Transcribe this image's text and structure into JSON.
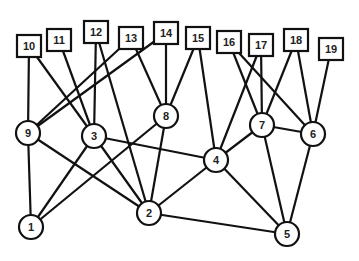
{
  "diagram": {
    "type": "graph",
    "square_nodes": [
      {
        "id": "10",
        "x": 29,
        "y": 46
      },
      {
        "id": "11",
        "x": 59,
        "y": 40
      },
      {
        "id": "12",
        "x": 96,
        "y": 32
      },
      {
        "id": "13",
        "x": 131,
        "y": 38
      },
      {
        "id": "14",
        "x": 166,
        "y": 33
      },
      {
        "id": "15",
        "x": 198,
        "y": 38
      },
      {
        "id": "16",
        "x": 229,
        "y": 42
      },
      {
        "id": "17",
        "x": 261,
        "y": 45
      },
      {
        "id": "18",
        "x": 296,
        "y": 40
      },
      {
        "id": "19",
        "x": 331,
        "y": 49
      }
    ],
    "circle_nodes": [
      {
        "id": "9",
        "x": 28,
        "y": 133
      },
      {
        "id": "3",
        "x": 94,
        "y": 136
      },
      {
        "id": "8",
        "x": 166,
        "y": 116
      },
      {
        "id": "7",
        "x": 262,
        "y": 125
      },
      {
        "id": "6",
        "x": 313,
        "y": 134
      },
      {
        "id": "4",
        "x": 216,
        "y": 160
      },
      {
        "id": "1",
        "x": 31,
        "y": 227
      },
      {
        "id": "2",
        "x": 149,
        "y": 213
      },
      {
        "id": "5",
        "x": 287,
        "y": 234
      }
    ],
    "edges": [
      [
        "10",
        "9"
      ],
      [
        "10",
        "3"
      ],
      [
        "11",
        "3"
      ],
      [
        "12",
        "3"
      ],
      [
        "12",
        "2"
      ],
      [
        "13",
        "9"
      ],
      [
        "13",
        "8"
      ],
      [
        "14",
        "9"
      ],
      [
        "14",
        "8"
      ],
      [
        "15",
        "8"
      ],
      [
        "15",
        "4"
      ],
      [
        "16",
        "7"
      ],
      [
        "16",
        "6"
      ],
      [
        "17",
        "7"
      ],
      [
        "17",
        "4"
      ],
      [
        "18",
        "7"
      ],
      [
        "18",
        "6"
      ],
      [
        "19",
        "6"
      ],
      [
        "9",
        "1"
      ],
      [
        "9",
        "2"
      ],
      [
        "3",
        "1"
      ],
      [
        "3",
        "2"
      ],
      [
        "3",
        "4"
      ],
      [
        "8",
        "1"
      ],
      [
        "8",
        "2"
      ],
      [
        "4",
        "2"
      ],
      [
        "4",
        "7"
      ],
      [
        "4",
        "5"
      ],
      [
        "7",
        "6"
      ],
      [
        "7",
        "5"
      ],
      [
        "6",
        "5"
      ],
      [
        "2",
        "5"
      ]
    ]
  }
}
